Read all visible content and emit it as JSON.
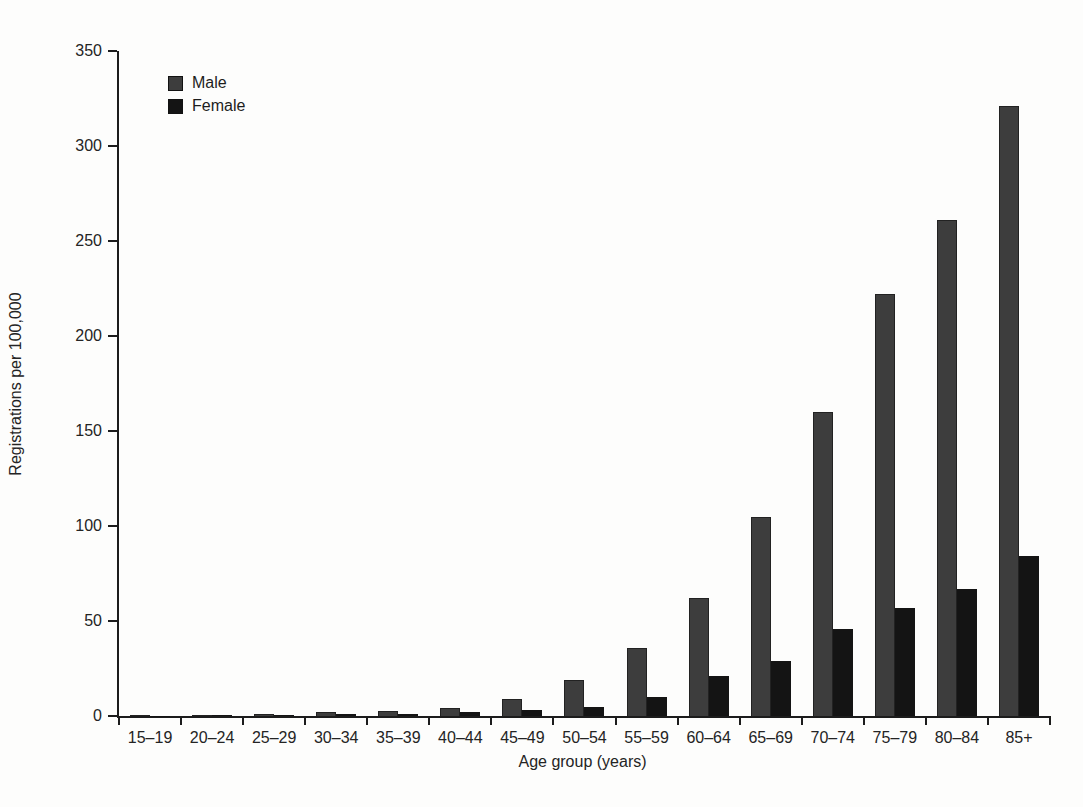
{
  "chart_data": {
    "type": "bar",
    "title": "",
    "xlabel": "Age group (years)",
    "ylabel": "Registrations per 100,000",
    "categories": [
      "15–19",
      "20–24",
      "25–29",
      "30–34",
      "35–39",
      "40–44",
      "45–49",
      "50–54",
      "55–59",
      "60–64",
      "65–69",
      "70–74",
      "75–79",
      "80–84",
      "85+"
    ],
    "series": [
      {
        "name": "Male",
        "color": "#3d3d3d",
        "values": [
          0.2,
          0.5,
          1,
          2,
          2.5,
          4,
          9,
          19,
          36,
          62,
          105,
          160,
          222,
          261,
          321
        ]
      },
      {
        "name": "Female",
        "color": "#141414",
        "values": [
          0.1,
          0.3,
          0.5,
          1,
          1.2,
          2,
          3,
          5,
          10,
          21,
          29,
          46,
          57,
          67,
          84
        ]
      }
    ],
    "ylim": [
      0,
      350
    ],
    "yticks": [
      0,
      50,
      100,
      150,
      200,
      250,
      300,
      350
    ],
    "grid": false,
    "legend_position": "top-left",
    "axis_color": "#1c1c1c",
    "background_color": "#fdfdfc"
  }
}
